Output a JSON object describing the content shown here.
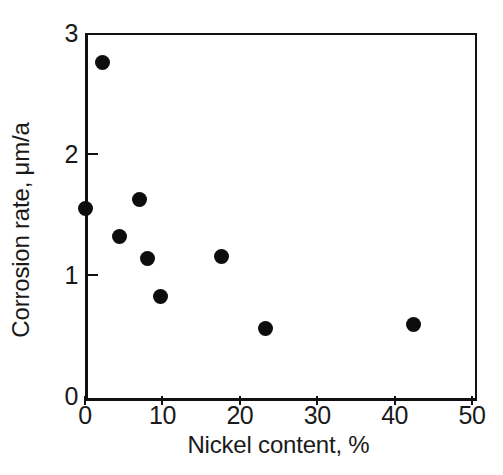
{
  "chart_data": {
    "type": "scatter",
    "title": "",
    "xlabel": "Nickel content, %",
    "ylabel": "Corrosion rate, μm/a",
    "xlim": [
      0,
      50
    ],
    "ylim": [
      0,
      3
    ],
    "xticks": [
      0,
      10,
      20,
      30,
      40,
      50
    ],
    "xticklabels": [
      "0",
      "10",
      "20",
      "30",
      "40",
      "50"
    ],
    "yticks": [
      0,
      1,
      2,
      3
    ],
    "yticklabels": [
      "0",
      "1",
      "2",
      "3"
    ],
    "grid": false,
    "legend": null,
    "marker": {
      "shape": "circle",
      "color": "#0d0d0d",
      "size": 15
    },
    "points": [
      {
        "x": 2.2,
        "y": 2.76
      },
      {
        "x": 0.1,
        "y": 1.55
      },
      {
        "x": 7.0,
        "y": 1.62
      },
      {
        "x": 4.5,
        "y": 1.32
      },
      {
        "x": 8.1,
        "y": 1.14
      },
      {
        "x": 9.7,
        "y": 0.82
      },
      {
        "x": 17.7,
        "y": 1.15
      },
      {
        "x": 23.3,
        "y": 0.56
      },
      {
        "x": 42.4,
        "y": 0.59
      }
    ]
  },
  "colors": {
    "axis": "#111111",
    "text": "#1a1a1a",
    "marker": "#0d0d0d",
    "background": "#ffffff"
  },
  "caption": {
    "remnant": ""
  }
}
